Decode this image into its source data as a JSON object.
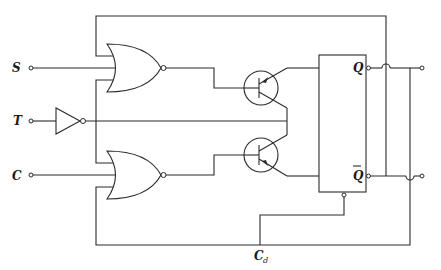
{
  "diagram": {
    "type": "circuit-schematic",
    "inputs": {
      "s_label": "S",
      "t_label": "T",
      "c_label": "C"
    },
    "outputs": {
      "q_label": "Q",
      "qbar_label": "Q",
      "qbar_overline": true
    },
    "clear": {
      "label": "C",
      "subscript": "d"
    },
    "components": [
      {
        "id": "nor-upper",
        "kind": "NOR gate",
        "inputs": [
          "feedback-top",
          "S",
          "T-branch"
        ]
      },
      {
        "id": "nor-lower",
        "kind": "NOR gate",
        "inputs": [
          "T-branch",
          "C",
          "feedback-bottom"
        ]
      },
      {
        "id": "inverter-t",
        "kind": "inverter (buffer with bubble)",
        "input": "T"
      },
      {
        "id": "transistor-upper",
        "kind": "PNP transistor"
      },
      {
        "id": "transistor-lower",
        "kind": "PNP transistor"
      },
      {
        "id": "flip-flop",
        "kind": "bistable flip-flop",
        "outputs": [
          "Q",
          "Q-bar"
        ],
        "clear_input": "Cd"
      }
    ],
    "colors": {
      "line": "#2a2a2a",
      "background": "#ffffff"
    }
  }
}
